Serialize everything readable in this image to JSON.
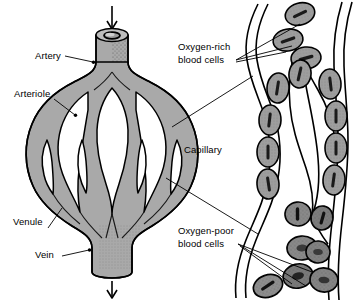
{
  "figure": {
    "type": "biology-diagram",
    "background_color": "#ffffff",
    "line_color": "#000000",
    "vessel_fill": "#a9a9a9",
    "cell_fill": "#9e9e9e",
    "cell_fill_dark": "#6e6e6e"
  },
  "labels": {
    "artery": "Artery",
    "arteriole": "Arteriole",
    "venule": "Venule",
    "vein": "Vein",
    "capillary": "Capillary",
    "oxygen_rich_line1": "Oxygen-rich",
    "oxygen_rich_line2": "blood cells",
    "oxygen_poor_line1": "Oxygen-poor",
    "oxygen_poor_line2": "blood cells"
  },
  "flow": {
    "inflow_arrow": "arrow-down",
    "outflow_arrow": "arrow-down"
  },
  "panels": {
    "left": {
      "name": "vascular-network-overview",
      "parts": [
        "Artery",
        "Arteriole",
        "Capillary bed",
        "Venule",
        "Vein"
      ]
    },
    "right": {
      "name": "capillary-closeup",
      "cell_groups": [
        {
          "name": "oxygen-rich blood cells",
          "shading": "light",
          "count": 14
        },
        {
          "name": "oxygen-poor blood cells",
          "shading": "dark",
          "count": 6
        }
      ]
    }
  }
}
